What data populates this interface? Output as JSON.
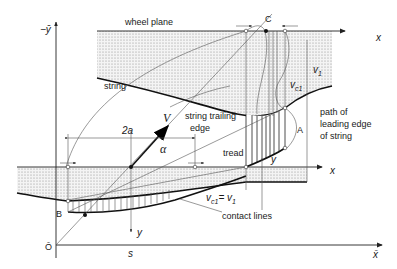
{
  "labels": {
    "neg_y_axis": "−ȳ",
    "wheel_plane": "wheel plane",
    "string": "string",
    "point_C": "C",
    "x_top": "x",
    "v1_top": "v",
    "v1_top_sub": "1",
    "vc1_top": "v",
    "vc1_top_sub": "c1",
    "path_leading_edge_1": "path of",
    "path_leading_edge_2": "leading edge",
    "path_leading_edge_3": "of string",
    "point_A": "A",
    "two_a": "2a",
    "V": "V",
    "string_trailing_1": "string trailing",
    "string_trailing_2": "edge",
    "alpha": "α",
    "tread": "tread",
    "y_right": "y",
    "x_mid": "x",
    "point_B": "B",
    "vc1_eq_v1": "v",
    "vc1_eq_v1_sub": "c1",
    "vc1_eq_v1_rest": "= v",
    "vc1_eq_v1_rest_sub": "1",
    "contact_lines": "contact lines",
    "y_left": "y",
    "origin": "Ō",
    "s_label": "s",
    "x_bar": "x̄"
  },
  "colors": {
    "ink": "#1a1a1a",
    "hatch_dot": "#8a8a8a",
    "background": "#ffffff"
  }
}
